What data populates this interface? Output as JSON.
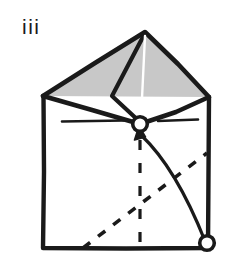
{
  "figure": {
    "kind": "origami-fold-diagram",
    "step_label": "iii",
    "caption_text": "",
    "background_color": "#ffffff",
    "ink_color": "#1a1a1a",
    "shaded_fill_color": "#c8c8c8",
    "paper_fill_color": "#ffffff"
  },
  "geometry": {
    "square": {
      "name": "paper-square-outline",
      "top_left": [
        43,
        96
      ],
      "top_right": [
        209,
        97
      ],
      "bottom_right": [
        208,
        248
      ],
      "bottom_left": [
        43,
        248
      ],
      "stroke_width": 4.2
    },
    "shaded_kite": {
      "name": "shaded-flap",
      "apex": [
        145,
        32
      ],
      "left": [
        43,
        96
      ],
      "center": [
        140,
        124
      ],
      "right": [
        209,
        97
      ],
      "fill": "#c8c8c8"
    },
    "fold_lines": [
      {
        "name": "kite-left-crease",
        "from": [
          145,
          32
        ],
        "to": [
          112,
          96
        ]
      },
      {
        "name": "kite-inner-crease",
        "from": [
          112,
          96
        ],
        "to": [
          140,
          124
        ]
      },
      {
        "name": "kite-highlight-crease",
        "from": [
          145,
          34
        ],
        "to": [
          140,
          120
        ],
        "color": "#ffffff"
      }
    ],
    "crease_marks": [
      {
        "name": "crease-mark-left",
        "from": [
          62,
          121
        ],
        "to": [
          124,
          120
        ]
      },
      {
        "name": "crease-mark-right",
        "from": [
          158,
          121
        ],
        "to": [
          198,
          119
        ]
      }
    ],
    "dashed_lines": [
      {
        "name": "dashed-diagonal-valley",
        "from": [
          83,
          248
        ],
        "to": [
          207,
          153
        ],
        "dash": "9 9"
      },
      {
        "name": "dashed-vertical-center",
        "from": [
          140,
          140
        ],
        "to": [
          140,
          248
        ],
        "dash": "9 11"
      }
    ],
    "arrow": {
      "name": "fold-motion-arrow",
      "path_from": [
        205,
        243
      ],
      "path_control": [
        178,
        168
      ],
      "path_to": [
        141,
        134
      ],
      "head_tip": [
        139,
        128
      ],
      "head_angle_deg": -78
    },
    "vertices": [
      {
        "name": "center-vertex-marker",
        "cx": 140,
        "cy": 124,
        "r": 7.5,
        "fill": "#ffffff"
      },
      {
        "name": "corner-vertex-marker",
        "cx": 207,
        "cy": 243,
        "r": 7.5,
        "fill": "#ffffff"
      }
    ]
  }
}
